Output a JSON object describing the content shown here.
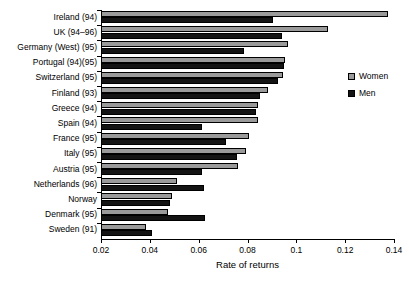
{
  "chart_data": {
    "type": "bar",
    "orientation": "horizontal",
    "title": "",
    "xlabel": "Rate of returns",
    "ylabel": "",
    "xlim": [
      0.02,
      0.14
    ],
    "xticks": [
      "0.02",
      "0.04",
      "0.06",
      "0.08",
      "0.1",
      "0.12",
      "0.14"
    ],
    "xtick_values": [
      0.02,
      0.04,
      0.06,
      0.08,
      0.1,
      0.12,
      0.14
    ],
    "grid": false,
    "legend_position": "right",
    "categories": [
      "Ireland (94)",
      "UK (94–96)",
      "Germany (West) (95)",
      "Portugal (94)(95)",
      "Switzerland (95)",
      "Finland (93)",
      "Greece (94)",
      "Spain (94)",
      "France (95)",
      "Italy (95)",
      "Austria (95)",
      "Netherlands (96)",
      "Norway",
      "Denmark (95)",
      "Sweden (91)"
    ],
    "series": [
      {
        "name": "Women",
        "color": "#9a9a9a",
        "values": [
          0.1376,
          0.113,
          0.0966,
          0.0955,
          0.0946,
          0.0885,
          0.0844,
          0.0844,
          0.0807,
          0.0795,
          0.0762,
          0.0512,
          0.0489,
          0.0475,
          0.0385
        ]
      },
      {
        "name": "Men",
        "color": "#141414",
        "values": [
          0.0905,
          0.0941,
          0.0786,
          0.095,
          0.0926,
          0.0852,
          0.0836,
          0.0614,
          0.0712,
          0.0758,
          0.0614,
          0.0622,
          0.0482,
          0.0626,
          0.0409
        ]
      }
    ]
  },
  "legend": {
    "items": [
      {
        "label": "Women",
        "color": "#9a9a9a"
      },
      {
        "label": "Men",
        "color": "#141414"
      }
    ]
  },
  "axis": {
    "x_title": "Rate of returns"
  }
}
